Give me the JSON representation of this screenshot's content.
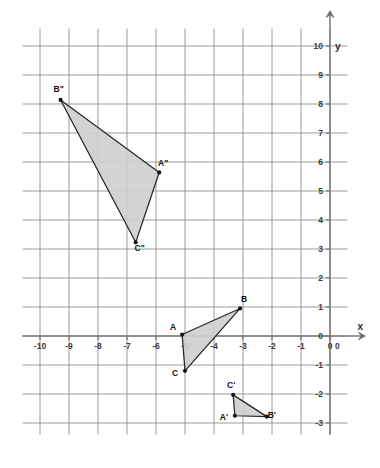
{
  "chart_data": {
    "type": "scatter",
    "title": "",
    "xlabel": "x",
    "ylabel": "y",
    "grid": true,
    "legend": "none",
    "xlim": [
      -10.6,
      0.6
    ],
    "ylim": [
      -3.4,
      10.6
    ],
    "x_ticks": [
      -10,
      -9,
      -8,
      -7,
      -6,
      -5,
      -4,
      -3,
      -2,
      -1,
      0
    ],
    "y_ticks": [
      -3,
      -2,
      -1,
      0,
      1,
      2,
      3,
      4,
      5,
      6,
      7,
      8,
      9,
      10
    ],
    "x_tick_labels": [
      "-10",
      "-9",
      "-8",
      "-7",
      "-6",
      "-5",
      "-4",
      "-3",
      "-2",
      "-1",
      "0"
    ],
    "y_tick_labels": [
      "-3",
      "-2",
      "-1",
      "0",
      "1",
      "2",
      "3",
      "4",
      "5",
      "6",
      "7",
      "8",
      "9",
      "10"
    ],
    "series": [
      {
        "name": "triangle-ABC",
        "shape": "triangle",
        "fill": "#cfcfcf",
        "points": [
          {
            "label": "A",
            "x": -5.1,
            "y": 0.05,
            "label_dx": -9,
            "label_dy": -5
          },
          {
            "label": "B",
            "x": -3.1,
            "y": 0.95,
            "label_dx": 4,
            "label_dy": -6
          },
          {
            "label": "C",
            "x": -5.0,
            "y": -1.2,
            "label_dx": -10,
            "label_dy": 5
          }
        ]
      },
      {
        "name": "triangle-A-prime-B-prime-C-prime",
        "shape": "triangle",
        "fill": "#cfcfcf",
        "points": [
          {
            "label": "A'",
            "x": -3.28,
            "y": -2.75,
            "label_dx": -11,
            "label_dy": 4
          },
          {
            "label": "B'",
            "x": -2.18,
            "y": -2.78,
            "label_dx": 5,
            "label_dy": 1
          },
          {
            "label": "C'",
            "x": -3.34,
            "y": -2.03,
            "label_dx": -2,
            "label_dy": -7
          }
        ]
      },
      {
        "name": "triangle-A-double-prime-B-double-prime-C-double-prime",
        "shape": "triangle",
        "fill": "#cfcfcf",
        "points": [
          {
            "label": "A\"",
            "x": -5.89,
            "y": 5.64,
            "label_dx": 4,
            "label_dy": -6
          },
          {
            "label": "B\"",
            "x": -9.29,
            "y": 8.14,
            "label_dx": -2,
            "label_dy": -8
          },
          {
            "label": "C\"",
            "x": -6.7,
            "y": 3.23,
            "label_dx": 4,
            "label_dy": 9
          }
        ]
      }
    ]
  },
  "axes": {
    "x_axis_label": "x",
    "y_axis_label": "y",
    "origin_label": "0"
  },
  "colors": {
    "grid": "#8f8f8f",
    "axis": "#7a7a7a",
    "triangle_fill": "#cfcfcf",
    "triangle_stroke": "#262626",
    "label_text": "#111111",
    "tick_text": "#3b3b3b",
    "background": "#ffffff"
  }
}
